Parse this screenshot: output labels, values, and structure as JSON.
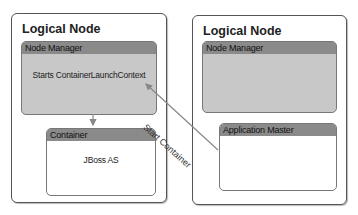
{
  "diagram": {
    "left_node": {
      "title": "Logical Node",
      "node_manager": {
        "header": "Node Manager",
        "body": "Starts ContainerLaunchContext"
      },
      "container": {
        "header": "Container",
        "body": "JBoss AS"
      }
    },
    "right_node": {
      "title": "Logical Node",
      "node_manager": {
        "header": "Node Manager",
        "body": ""
      },
      "application_master": {
        "header": "Application Master",
        "body": ""
      }
    },
    "edges": [
      {
        "from": "node_manager",
        "to": "container",
        "label": ""
      },
      {
        "from": "application_master",
        "to": "node_manager",
        "label": "Start Container"
      }
    ],
    "colors": {
      "header": "#8a8a8a",
      "gray_body": "#c8c8c8",
      "border": "#555555"
    }
  }
}
